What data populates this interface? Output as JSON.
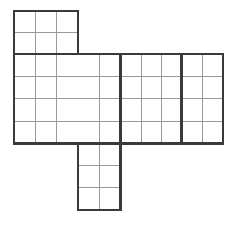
{
  "figure": {
    "title": "Grid net diagram",
    "description": "Black-outlined polyomino net composed of three rectangular panels subdivided into unit square cells on a white background.",
    "canvas": {
      "width": 239,
      "height": 226
    },
    "colors": {
      "background": "#ffffff",
      "thick_outline": "#3a3a3a",
      "thin_gridline": "#9a9a9a",
      "cell_fill": "#ffffff"
    },
    "line_weights": {
      "thick": 2.4,
      "thin": 1.0
    },
    "cell_size": {
      "width": 21.3,
      "height": 22.3
    }
  },
  "geometry": {
    "x_gridlines": [
      14,
      35.2,
      56.5,
      77.8,
      99.0,
      120.3,
      141.0,
      161.2,
      181.3,
      202.2,
      223.0
    ],
    "y_gridlines_top": [
      11,
      32.3,
      54.0
    ],
    "y_gridlines_body": [
      54.0,
      76.4,
      98.8,
      121.2,
      143.6
    ],
    "y_gridlines_bottom": [
      143.6,
      165.6,
      187.6,
      209.8
    ]
  },
  "panels": [
    {
      "name": "top-panel",
      "label": "Top panel",
      "x0": 14,
      "y0": 11,
      "x1": 77.8,
      "y1": 54.0,
      "cols": 3,
      "rows": 2,
      "cell_count": 6
    },
    {
      "name": "main-panel-left",
      "label": "Main panel left section",
      "x0": 14,
      "y0": 54.0,
      "x1": 120.3,
      "y1": 143.6,
      "cols": 5,
      "rows": 4,
      "cell_count": 20
    },
    {
      "name": "main-panel-middle",
      "label": "Main panel middle section",
      "x0": 120.3,
      "y0": 54.0,
      "x1": 181.3,
      "y1": 143.6,
      "cols": 3,
      "rows": 4,
      "cell_count": 12
    },
    {
      "name": "main-panel-right",
      "label": "Main panel right section",
      "x0": 181.3,
      "y0": 54.0,
      "x1": 223.0,
      "y1": 143.6,
      "cols": 2,
      "rows": 4,
      "cell_count": 8
    },
    {
      "name": "bottom-panel",
      "label": "Bottom panel",
      "x0": 77.8,
      "y0": 143.6,
      "x1": 120.3,
      "y1": 209.8,
      "cols": 2,
      "rows": 3,
      "cell_count": 6
    }
  ],
  "thin_gridlines": {
    "vertical": [
      {
        "x": 35.2,
        "y0": 11,
        "y1": 143.6
      },
      {
        "x": 56.5,
        "y0": 11,
        "y1": 143.6
      },
      {
        "x": 99.0,
        "y0": 54.0,
        "y1": 143.6
      },
      {
        "x": 141.0,
        "y0": 54.0,
        "y1": 143.6
      },
      {
        "x": 161.2,
        "y0": 54.0,
        "y1": 143.6
      },
      {
        "x": 202.2,
        "y0": 54.0,
        "y1": 143.6
      },
      {
        "x": 99.0,
        "y0": 143.6,
        "y1": 209.8
      }
    ],
    "horizontal": [
      {
        "y": 32.3,
        "x0": 14,
        "x1": 77.8
      },
      {
        "y": 76.4,
        "x0": 14,
        "x1": 223.0
      },
      {
        "y": 98.8,
        "x0": 14,
        "x1": 223.0
      },
      {
        "y": 121.2,
        "x0": 14,
        "x1": 223.0
      },
      {
        "y": 165.6,
        "x0": 77.8,
        "x1": 120.3
      },
      {
        "y": 187.6,
        "x0": 77.8,
        "x1": 120.3
      }
    ]
  },
  "thick_outline_segments": {
    "vertical": [
      {
        "x": 14,
        "y0": 11,
        "y1": 143.6,
        "name": "left-outer-edge"
      },
      {
        "x": 77.8,
        "y0": 11,
        "y1": 54.0,
        "name": "top-panel-right-edge"
      },
      {
        "x": 77.8,
        "y0": 143.6,
        "y1": 209.8,
        "name": "bottom-panel-left-edge"
      },
      {
        "x": 120.3,
        "y0": 54.0,
        "y1": 209.8,
        "name": "middle-divider"
      },
      {
        "x": 181.3,
        "y0": 54.0,
        "y1": 143.6,
        "name": "right-divider"
      },
      {
        "x": 223.0,
        "y0": 54.0,
        "y1": 143.6,
        "name": "right-outer-edge"
      }
    ],
    "horizontal": [
      {
        "y": 11,
        "x0": 14,
        "x1": 77.8,
        "name": "top-panel-top-edge"
      },
      {
        "y": 54.0,
        "x0": 14,
        "x1": 223.0,
        "name": "main-panel-top-edge"
      },
      {
        "y": 143.6,
        "x0": 14,
        "x1": 223.0,
        "name": "main-panel-bottom-edge"
      },
      {
        "y": 209.8,
        "x0": 77.8,
        "x1": 120.3,
        "name": "bottom-panel-bottom-edge"
      }
    ]
  },
  "totals": {
    "cell_count": 52,
    "panel_count": 5
  }
}
